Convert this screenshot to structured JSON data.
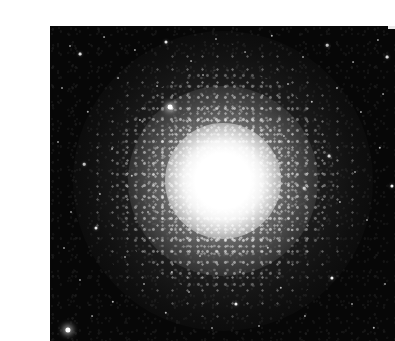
{
  "page": {
    "background_color": "#ffffff",
    "width": 365,
    "height": 340
  },
  "photo": {
    "name": "globular-cluster-photograph",
    "alt_text": "Black and white astronomical photograph of a globular star cluster",
    "frame": {
      "x": 10,
      "y": 10,
      "width": 345,
      "height": 315
    },
    "background_color": "#070707",
    "star_color": "#ffffff",
    "core": {
      "center_x": 183,
      "center_y": 165,
      "saturated_radius": 30,
      "glow_radius": 58,
      "halo_mid_radius": 95,
      "halo_outer_radius": 150
    },
    "edge_notch": {
      "x": 348,
      "y": 8,
      "width": 7,
      "height": 5,
      "color": "#e9e9e9"
    },
    "field_stars": [
      {
        "x": 30,
        "y": 30,
        "r": 1.0,
        "o": 0.55
      },
      {
        "x": 40,
        "y": 38,
        "r": 1.4,
        "o": 0.85
      },
      {
        "x": 64,
        "y": 21,
        "r": 0.9,
        "o": 0.5
      },
      {
        "x": 95,
        "y": 34,
        "r": 1.1,
        "o": 0.6
      },
      {
        "x": 126,
        "y": 26,
        "r": 1.5,
        "o": 0.9
      },
      {
        "x": 151,
        "y": 45,
        "r": 0.9,
        "o": 0.5
      },
      {
        "x": 176,
        "y": 23,
        "r": 1.0,
        "o": 0.55
      },
      {
        "x": 205,
        "y": 36,
        "r": 0.9,
        "o": 0.45
      },
      {
        "x": 232,
        "y": 20,
        "r": 1.2,
        "o": 0.7
      },
      {
        "x": 263,
        "y": 41,
        "r": 1.0,
        "o": 0.55
      },
      {
        "x": 287,
        "y": 29,
        "r": 1.3,
        "o": 0.75
      },
      {
        "x": 313,
        "y": 46,
        "r": 0.9,
        "o": 0.5
      },
      {
        "x": 338,
        "y": 24,
        "r": 1.1,
        "o": 0.6
      },
      {
        "x": 347,
        "y": 41,
        "r": 1.4,
        "o": 0.85
      },
      {
        "x": 22,
        "y": 72,
        "r": 1.0,
        "o": 0.55
      },
      {
        "x": 48,
        "y": 96,
        "r": 1.2,
        "o": 0.65
      },
      {
        "x": 78,
        "y": 62,
        "r": 0.9,
        "o": 0.5
      },
      {
        "x": 100,
        "y": 104,
        "r": 1.1,
        "o": 0.6
      },
      {
        "x": 130,
        "y": 91,
        "r": 2.4,
        "o": 1.0
      },
      {
        "x": 117,
        "y": 70,
        "r": 0.9,
        "o": 0.5
      },
      {
        "x": 163,
        "y": 59,
        "r": 1.0,
        "o": 0.55
      },
      {
        "x": 248,
        "y": 68,
        "r": 1.0,
        "o": 0.6
      },
      {
        "x": 272,
        "y": 86,
        "r": 1.2,
        "o": 0.7
      },
      {
        "x": 297,
        "y": 72,
        "r": 1.0,
        "o": 0.55
      },
      {
        "x": 321,
        "y": 96,
        "r": 1.1,
        "o": 0.6
      },
      {
        "x": 343,
        "y": 78,
        "r": 0.9,
        "o": 0.5
      },
      {
        "x": 18,
        "y": 126,
        "r": 1.0,
        "o": 0.55
      },
      {
        "x": 44,
        "y": 148,
        "r": 1.3,
        "o": 0.75
      },
      {
        "x": 72,
        "y": 133,
        "r": 1.0,
        "o": 0.55
      },
      {
        "x": 60,
        "y": 178,
        "r": 1.1,
        "o": 0.6
      },
      {
        "x": 31,
        "y": 196,
        "r": 1.0,
        "o": 0.55
      },
      {
        "x": 289,
        "y": 140,
        "r": 1.4,
        "o": 0.85
      },
      {
        "x": 315,
        "y": 156,
        "r": 1.0,
        "o": 0.55
      },
      {
        "x": 340,
        "y": 132,
        "r": 1.2,
        "o": 0.7
      },
      {
        "x": 352,
        "y": 170,
        "r": 1.6,
        "o": 0.95
      },
      {
        "x": 300,
        "y": 186,
        "r": 1.1,
        "o": 0.6
      },
      {
        "x": 327,
        "y": 204,
        "r": 1.0,
        "o": 0.55
      },
      {
        "x": 264,
        "y": 172,
        "r": 1.3,
        "o": 0.75
      },
      {
        "x": 24,
        "y": 232,
        "r": 1.0,
        "o": 0.55
      },
      {
        "x": 56,
        "y": 212,
        "r": 1.5,
        "o": 0.9
      },
      {
        "x": 85,
        "y": 241,
        "r": 1.0,
        "o": 0.55
      },
      {
        "x": 110,
        "y": 222,
        "r": 1.1,
        "o": 0.6
      },
      {
        "x": 40,
        "y": 264,
        "r": 1.0,
        "o": 0.55
      },
      {
        "x": 73,
        "y": 286,
        "r": 1.2,
        "o": 0.7
      },
      {
        "x": 28,
        "y": 314,
        "r": 2.6,
        "o": 1.0
      },
      {
        "x": 52,
        "y": 300,
        "r": 0.9,
        "o": 0.5
      },
      {
        "x": 104,
        "y": 268,
        "r": 1.0,
        "o": 0.55
      },
      {
        "x": 126,
        "y": 297,
        "r": 1.2,
        "o": 0.7
      },
      {
        "x": 149,
        "y": 276,
        "r": 1.0,
        "o": 0.55
      },
      {
        "x": 132,
        "y": 256,
        "r": 1.1,
        "o": 0.6
      },
      {
        "x": 172,
        "y": 312,
        "r": 1.0,
        "o": 0.55
      },
      {
        "x": 196,
        "y": 288,
        "r": 1.6,
        "o": 0.95
      },
      {
        "x": 219,
        "y": 310,
        "r": 1.0,
        "o": 0.55
      },
      {
        "x": 241,
        "y": 272,
        "r": 1.2,
        "o": 0.7
      },
      {
        "x": 200,
        "y": 256,
        "r": 1.0,
        "o": 0.55
      },
      {
        "x": 265,
        "y": 300,
        "r": 1.1,
        "o": 0.6
      },
      {
        "x": 292,
        "y": 262,
        "r": 1.6,
        "o": 0.95
      },
      {
        "x": 312,
        "y": 288,
        "r": 1.0,
        "o": 0.55
      },
      {
        "x": 334,
        "y": 312,
        "r": 1.2,
        "o": 0.7
      },
      {
        "x": 345,
        "y": 268,
        "r": 1.0,
        "o": 0.55
      },
      {
        "x": 160,
        "y": 240,
        "r": 1.0,
        "o": 0.6
      },
      {
        "x": 228,
        "y": 232,
        "r": 1.2,
        "o": 0.7
      },
      {
        "x": 252,
        "y": 214,
        "r": 1.0,
        "o": 0.55
      },
      {
        "x": 92,
        "y": 160,
        "r": 1.2,
        "o": 0.7
      },
      {
        "x": 108,
        "y": 196,
        "r": 1.0,
        "o": 0.55
      },
      {
        "x": 244,
        "y": 120,
        "r": 1.1,
        "o": 0.6
      }
    ]
  }
}
